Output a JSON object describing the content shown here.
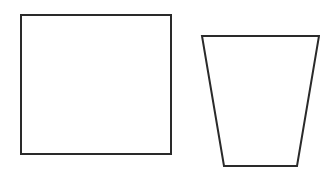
{
  "canvas": {
    "width": 320,
    "height": 174,
    "background": "#ffffff"
  },
  "stroke": {
    "color": "#2a2a2a",
    "width": 2
  },
  "shapes": [
    {
      "name": "square",
      "type": "rectangle",
      "x": 21,
      "y": 15,
      "width": 150,
      "height": 139
    },
    {
      "name": "trapezoid",
      "type": "polygon",
      "points": "202,36 319,36 297,166 224,166"
    }
  ]
}
